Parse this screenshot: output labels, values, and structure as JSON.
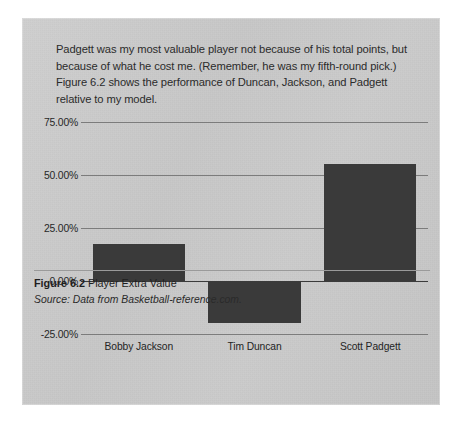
{
  "page": {
    "background_color": "#ffffff",
    "panel_color": "#c9c9c9"
  },
  "body_text": {
    "paragraph": "Padgett was my most valuable player not because of his total points, but because of what he cost me. (Remember, he was my fifth-round pick.) Figure 6.2 shows the performance of Duncan, Jackson, and Padgett relative to my model."
  },
  "caption": {
    "figure_number": "Figure 6.2",
    "figure_title": "Player Extra Value",
    "source": "Source: Data from Basketball-reference.com."
  },
  "chart_data": {
    "type": "bar",
    "title": "Player Extra Value",
    "categories": [
      "Bobby Jackson",
      "Tim Duncan",
      "Scott Padgett"
    ],
    "values": [
      17.5,
      -20.0,
      55.0
    ],
    "value_format": "percent",
    "xlabel": "",
    "ylabel": "",
    "ylim": [
      -25,
      75
    ],
    "yticks": [
      75,
      50,
      25,
      0,
      -25
    ],
    "ytick_labels": [
      "75.00%",
      "50.00%",
      "25.00%",
      "0.00%",
      "-25.00%"
    ],
    "grid": true,
    "legend": false,
    "bar_color": "#3a3a3a",
    "gridline_color": "#6f6f6f",
    "zero_line_color": "#3b3b3b"
  }
}
